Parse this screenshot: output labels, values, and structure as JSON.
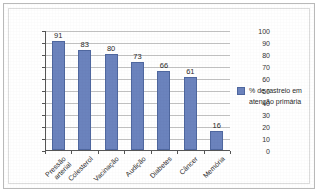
{
  "chart_data": {
    "type": "bar",
    "title": "",
    "xlabel": "",
    "ylabel": "",
    "ylim": [
      0,
      100
    ],
    "ytick_step": 10,
    "yticks": [
      0,
      10,
      20,
      30,
      40,
      50,
      60,
      70,
      80,
      90,
      100
    ],
    "grid": true,
    "legend_position": "right",
    "categories": [
      "Pressão\narterial",
      "Colesterol",
      "Vacinação",
      "Audição",
      "Diabetes",
      "Câncer",
      "Memória"
    ],
    "values": [
      91,
      83,
      80,
      73,
      66,
      61,
      16
    ],
    "series": [
      {
        "name": "% de rastreio em\natenção primária",
        "values": [
          91,
          83,
          80,
          73,
          66,
          61,
          16
        ],
        "color": "#6b83bd"
      }
    ],
    "data_labels": [
      "91",
      "83",
      "80",
      "73",
      "66",
      "61",
      "16"
    ]
  },
  "legend": {
    "entries": [
      {
        "label": "% de rastreio em\natenção primária",
        "color": "#6b83bd"
      }
    ]
  },
  "colors": {
    "bar": "#6b83bd",
    "bar_border": "#4f679f",
    "gridline": "#c2c2c2",
    "axis": "#555555",
    "frame": "#b9b9b9",
    "background": "#ffffff",
    "text": "#2b2b2b"
  }
}
